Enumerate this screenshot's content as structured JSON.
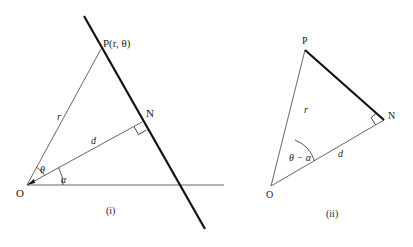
{
  "figure_i": {
    "caption": "(i)",
    "labels": {
      "origin": "O",
      "point_p": "P(r, θ)",
      "foot_n": "N",
      "radius": "r",
      "distance": "d",
      "angle_theta": "θ",
      "angle_alpha": "α"
    },
    "points": {
      "O": [
        27,
        185
      ],
      "P": [
        101,
        49
      ],
      "N": [
        142,
        122
      ],
      "line_top": [
        84,
        16
      ],
      "line_bottom": [
        205,
        229
      ],
      "axis_end": [
        224,
        185
      ]
    }
  },
  "figure_ii": {
    "caption": "(ii)",
    "labels": {
      "origin": "O",
      "point_p": "P",
      "foot_n": "N",
      "radius": "r",
      "distance": "d",
      "angle_diff": "θ − α"
    },
    "points": {
      "O": [
        271,
        186
      ],
      "P": [
        305,
        50
      ],
      "N": [
        384,
        120
      ]
    }
  },
  "colors": {
    "ink": "#1a1a1a",
    "thin_line": "#555555",
    "background": "#ffffff"
  }
}
